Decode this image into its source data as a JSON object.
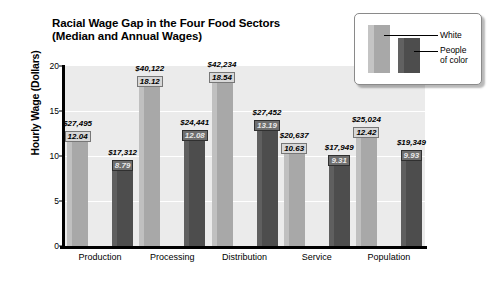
{
  "chart_data": {
    "type": "bar",
    "title": "Racial Wage Gap in  the Four Food Sectors",
    "subtitle": "(Median and Annual Wages)",
    "xlabel": "",
    "ylabel": "Hourly Wage (Dollars)",
    "ylim": [
      0,
      20
    ],
    "yticks": [
      0,
      5,
      10,
      15,
      20
    ],
    "ytick_labels": [
      "0",
      "5",
      "10",
      "15",
      "20"
    ],
    "grid": true,
    "grid_axis": "y",
    "legend_position": "top-right",
    "categories": [
      "Production",
      "Processing",
      "Distribution",
      "Service",
      "Population"
    ],
    "series": [
      {
        "name": "White",
        "color": "#a8a8a8",
        "values": [
          12.04,
          18.12,
          18.54,
          10.63,
          12.42
        ],
        "annual_wages": [
          "$27,495",
          "$40,122",
          "$42,234",
          "$20,637",
          "$25,024"
        ],
        "hourly_labels": [
          "12.04",
          "18.12",
          "18.54",
          "10.63",
          "12.42"
        ]
      },
      {
        "name": "People of color",
        "color": "#4d4d4d",
        "values": [
          8.79,
          12.08,
          13.19,
          9.31,
          9.93
        ],
        "annual_wages": [
          "$17,312",
          "$24,441",
          "$27,452",
          "$17,949",
          "$19,349"
        ],
        "hourly_labels": [
          "8.79",
          "12.08",
          "13.19",
          "9.31",
          "9.93"
        ]
      }
    ]
  },
  "legend": {
    "white_label": "White",
    "poc_label": "People\nof color"
  },
  "colors": {
    "white_bar": "#a8a8a8",
    "poc_bar": "#4d4d4d",
    "plot_background": "#ebebeb",
    "axis": "#000000"
  }
}
